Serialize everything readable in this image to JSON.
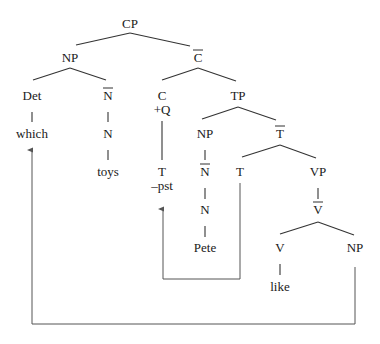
{
  "diagram": {
    "type": "syntax-tree",
    "nodes": {
      "cp": "CP",
      "np_spec": "NP",
      "c_bar": "C",
      "det": "Det",
      "n_bar_obj": "N",
      "c_head": "C",
      "c_feature": "+Q",
      "tp": "TP",
      "which": "which",
      "n_obj": "N",
      "np_subj": "NP",
      "t_bar": "T",
      "toys": "toys",
      "t_moved": "T",
      "t_feature": "–pst",
      "n_bar_subj": "N",
      "t_trace": "T",
      "vp": "VP",
      "n_subj": "N",
      "v_bar": "V",
      "pete": "Pete",
      "v_head": "V",
      "np_obj": "NP",
      "like": "like"
    },
    "bar_nodes": [
      "c_bar",
      "n_bar_obj",
      "n_bar_subj",
      "t_bar",
      "v_bar"
    ],
    "movements": [
      {
        "from": "t_trace",
        "to": "t_moved",
        "label": "T-to-C movement"
      },
      {
        "from": "np_obj",
        "to": "which",
        "label": "wh-movement"
      }
    ],
    "colors": {
      "text": "#1a1a1a",
      "branch": "#333333",
      "arrow": "#555555"
    }
  }
}
